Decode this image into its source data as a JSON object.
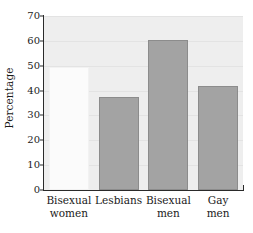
{
  "chart_data": {
    "type": "bar",
    "title": "",
    "subtitle": "",
    "xlabel": "",
    "ylabel": "Percentage",
    "categories": [
      "Bisexual women",
      "Lesbians",
      "Bisexual men",
      "Gay men"
    ],
    "category_lines": [
      [
        "Bisexual",
        "women"
      ],
      [
        "Lesbians",
        ""
      ],
      [
        "Bisexual",
        "men"
      ],
      [
        "Gay",
        "men"
      ]
    ],
    "values": [
      49.5,
      37.5,
      60.5,
      42
    ],
    "ylim": [
      0,
      70
    ],
    "yticks": [
      0,
      10,
      20,
      30,
      40,
      50,
      60,
      70
    ],
    "ytick_labels": [
      "0",
      "10",
      "20",
      "30",
      "40",
      "50",
      "60",
      "70"
    ],
    "grid": true,
    "legend": "none",
    "bar_colors": [
      "#fbfbfb",
      "#a3a3a3",
      "#a3a3a3",
      "#a3a3a3"
    ],
    "bar_border_colors": [
      "#f2f2f2",
      "#8c8c8c",
      "#8c8c8c",
      "#8c8c8c"
    ],
    "plot_background": "#eeeeee",
    "gridline_color": "#e3e3e3",
    "axis_color": "#2a2a2a"
  }
}
